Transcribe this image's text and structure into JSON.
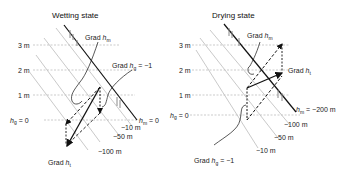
{
  "panels": [
    {
      "title": "Wetting state",
      "elevation_labels": [
        "3 m",
        "2 m",
        "1 m"
      ],
      "datum_label_var": "h",
      "datum_label_sub": "g",
      "datum_label_val": " = 0",
      "grad_hm": {
        "prefix": "Grad ",
        "var": "h",
        "sub": "m"
      },
      "grad_hg": {
        "prefix": "Grad ",
        "var": "h",
        "sub": "g",
        "suffix": " = −1"
      },
      "grad_ht": {
        "prefix": "Grad ",
        "var": "h",
        "sub": "t"
      },
      "surface_label": {
        "var": "h",
        "sub": "m",
        "suffix": " = 0"
      },
      "contours": [
        "−10 m",
        "−50 m",
        "−100 m"
      ]
    },
    {
      "title": "Drying state",
      "elevation_labels": [
        "3 m",
        "2 m",
        "1 m"
      ],
      "datum_label_var": "h",
      "datum_label_sub": "g",
      "datum_label_val": " = 0",
      "grad_hm": {
        "prefix": "Grad ",
        "var": "h",
        "sub": "m"
      },
      "grad_ht": {
        "prefix": "Grad ",
        "var": "h",
        "sub": "t"
      },
      "grad_hg": {
        "prefix": "Grad ",
        "var": "h",
        "sub": "g",
        "suffix": " = −1"
      },
      "surface_label": {
        "var": "h",
        "sub": "m",
        "suffix": " = −200 m"
      },
      "contours": [
        "−100 m",
        "−50 m",
        "−10 m"
      ]
    }
  ],
  "colors": {
    "line": "#111111",
    "guide": "#aaaaaa",
    "hatch": "#888888"
  }
}
